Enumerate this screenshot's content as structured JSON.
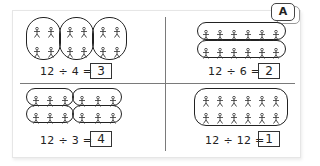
{
  "badge": {
    "label": "A"
  },
  "panels": [
    {
      "id": "top-left",
      "dividend": 12,
      "divisor": 4,
      "equation": "12 ÷ 4  =",
      "answer": "3",
      "grouping": "3 groups of 4 (oval)",
      "groups": 3,
      "per_group": 4
    },
    {
      "id": "top-right",
      "dividend": 12,
      "divisor": 6,
      "equation": "12 ÷ 6  =",
      "answer": "2",
      "grouping": "2 rows of 6",
      "groups": 2,
      "per_group": 6
    },
    {
      "id": "bottom-left",
      "dividend": 12,
      "divisor": 3,
      "equation": "12 ÷ 3  =",
      "answer": "4",
      "grouping": "4 groups of 3",
      "groups": 4,
      "per_group": 3
    },
    {
      "id": "bottom-right",
      "dividend": 12,
      "divisor": 12,
      "equation": "12 ÷ 12  =",
      "answer": "1",
      "grouping": "1 group of 12",
      "groups": 1,
      "per_group": 12
    }
  ],
  "colors": {
    "ink": "#222222",
    "divider": "#7a7a7a",
    "card_border": "#e6e6e6"
  }
}
